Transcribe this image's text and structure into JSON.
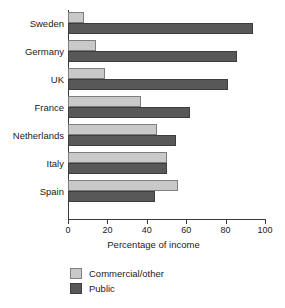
{
  "chart_data": {
    "type": "bar",
    "orientation": "horizontal",
    "title": "",
    "xlabel": "Percentage of income",
    "ylabel": "",
    "xlim": [
      0,
      100
    ],
    "xticks": [
      0,
      20,
      40,
      60,
      80,
      100
    ],
    "grid": false,
    "legend_position": "bottom-left",
    "categories": [
      "Sweden",
      "Germany",
      "UK",
      "France",
      "Netherlands",
      "Italy",
      "Spain"
    ],
    "series": [
      {
        "name": "Commercial/other",
        "color": "#c9c9c9",
        "values": [
          8,
          14,
          19,
          37,
          45,
          50,
          56
        ]
      },
      {
        "name": "Public",
        "color": "#585858",
        "values": [
          94,
          86,
          81,
          62,
          55,
          50,
          44
        ]
      }
    ]
  },
  "axis": {
    "x_title": "Percentage of income",
    "tick_labels": [
      "0",
      "20",
      "40",
      "60",
      "80",
      "100"
    ]
  },
  "legend": {
    "items": [
      {
        "label": "Commercial/other",
        "swatch": "light-gray-swatch"
      },
      {
        "label": "Public",
        "swatch": "dark-gray-swatch"
      }
    ]
  }
}
